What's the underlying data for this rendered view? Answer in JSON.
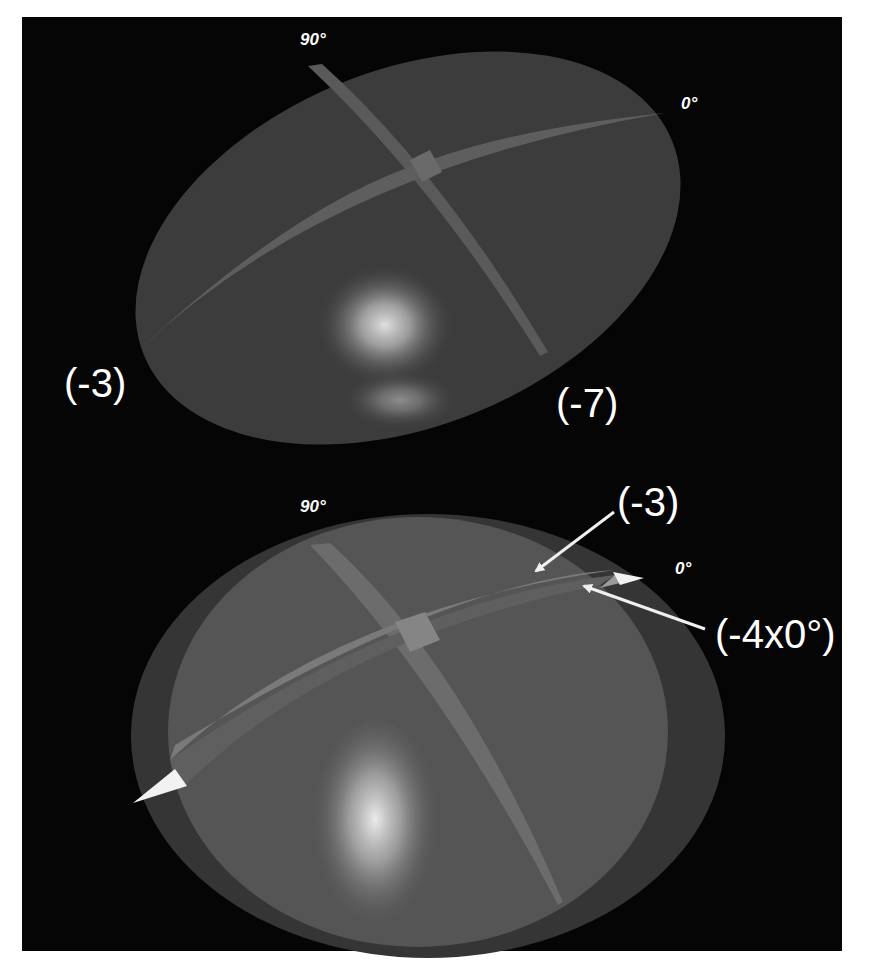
{
  "figure": {
    "background_color": "#050505",
    "top_panel": {
      "angle_labels": {
        "ninety": "90°",
        "zero": "0°"
      },
      "region_labels": {
        "left": "(-3)",
        "right": "(-7)"
      },
      "colors": {
        "dome": "#3c3c3c",
        "band": "#5e5e5e",
        "highlight": "#d8d8d8"
      }
    },
    "bottom_panel": {
      "angle_labels": {
        "ninety": "90°",
        "zero": "0°"
      },
      "callouts": {
        "upper": "(-3)",
        "lower": "(-4x0°)"
      },
      "colors": {
        "outer_dome": "#353535",
        "inner_dome": "#555555",
        "band_upper": "#7a7a7a",
        "band_lower": "#5f5f5f",
        "tip": "#f2f2f2",
        "highlight": "#e6e6e6",
        "arrow": "#f0f0f0"
      }
    }
  }
}
